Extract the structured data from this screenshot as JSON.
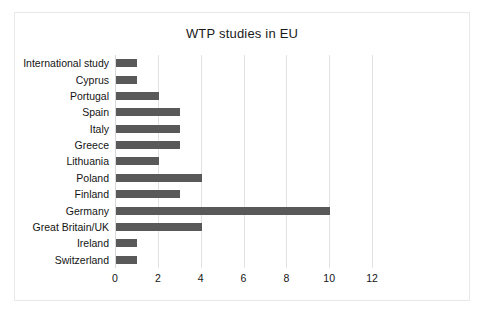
{
  "chart_data": {
    "type": "bar",
    "orientation": "horizontal",
    "title": "WTP studies in EU",
    "xlabel": "",
    "ylabel": "",
    "categories": [
      "International study",
      "Cyprus",
      "Portugal",
      "Spain",
      "Italy",
      "Greece",
      "Lithuania",
      "Poland",
      "Finland",
      "Germany",
      "Great Britain/UK",
      "Ireland",
      "Switzerland"
    ],
    "values": [
      1,
      1,
      2,
      3,
      3,
      3,
      2,
      4,
      3,
      10,
      4,
      1,
      1
    ],
    "xlim": [
      0,
      12
    ],
    "xticks": [
      0,
      2,
      4,
      6,
      8,
      10,
      12
    ],
    "xtick_labels": [
      "0",
      "2",
      "4",
      "6",
      "8",
      "10",
      "12"
    ],
    "grid": "vertical",
    "legend": "none",
    "bar_color": "#595959",
    "gridline_color": "#e2e2e2",
    "frame_color": "#e8e8e8",
    "background": "#ffffff"
  }
}
